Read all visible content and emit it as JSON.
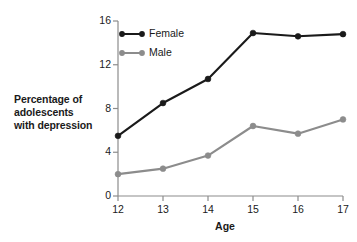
{
  "chart_data": {
    "type": "line",
    "title": "",
    "xlabel": "Age",
    "ylabel": "Percentage of adolescents with depression",
    "ylabel_lines": [
      "Percentage of",
      "adolescents",
      "with depression"
    ],
    "x": [
      12,
      13,
      14,
      15,
      16,
      17
    ],
    "categories": [
      "12",
      "13",
      "14",
      "15",
      "16",
      "17"
    ],
    "xtick_labels": [
      "12",
      "13",
      "14",
      "15",
      "16",
      "17"
    ],
    "ytick_labels": [
      "0",
      "4",
      "8",
      "12",
      "16"
    ],
    "ytick_values": [
      0,
      4,
      8,
      12,
      16
    ],
    "xlim": [
      12,
      17
    ],
    "ylim": [
      0,
      16
    ],
    "grid": false,
    "legend_position": "top-left-inside",
    "series": [
      {
        "name": "Female",
        "color": "#1a1a1a",
        "marker": "circle",
        "values": [
          5.5,
          8.5,
          10.7,
          14.9,
          14.6,
          14.8
        ]
      },
      {
        "name": "Male",
        "color": "#8c8c8c",
        "marker": "circle",
        "values": [
          2.0,
          2.5,
          3.7,
          6.4,
          5.7,
          7.0
        ]
      }
    ]
  },
  "colors": {
    "background": "#ffffff",
    "axis": "#8c8c8c",
    "text": "#1a1a1a",
    "female": "#1a1a1a",
    "male": "#8c8c8c"
  }
}
